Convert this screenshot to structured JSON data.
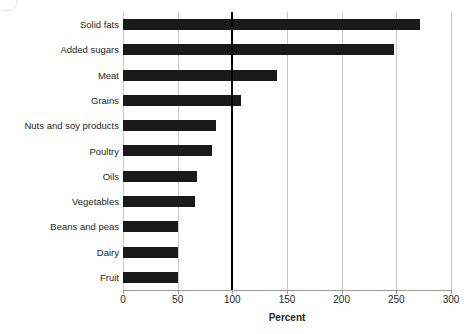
{
  "chart_data": {
    "type": "bar",
    "orientation": "horizontal",
    "title": "",
    "subtitle": "",
    "xlabel": "Percent",
    "ylabel": "",
    "xlim": [
      0,
      300
    ],
    "xticks": [
      0,
      50,
      100,
      150,
      200,
      250,
      300
    ],
    "xtick_labels": [
      "0",
      "50",
      "100",
      "150",
      "200",
      "250",
      "300"
    ],
    "grid": true,
    "grid_axis": "x",
    "legend": false,
    "legend_position": "none",
    "bar_color": "#1a1a1a",
    "reference_line": {
      "value": 100,
      "label": "",
      "color": "#000000",
      "width_px": 2
    },
    "categories": [
      "Solid fats",
      "Added sugars",
      "Meat",
      "Grains",
      "Nuts and soy products",
      "Poultry",
      "Oils",
      "Vegetables",
      "Beans and peas",
      "Dairy",
      "Fruit"
    ],
    "values": [
      272,
      248,
      141,
      108,
      85,
      81,
      68,
      66,
      50,
      50,
      50
    ],
    "points": [
      {
        "category": "Solid fats",
        "value": 272
      },
      {
        "category": "Added sugars",
        "value": 248
      },
      {
        "category": "Meat",
        "value": 141
      },
      {
        "category": "Grains",
        "value": 108
      },
      {
        "category": "Nuts and soy products",
        "value": 85
      },
      {
        "category": "Poultry",
        "value": 81
      },
      {
        "category": "Oils",
        "value": 68
      },
      {
        "category": "Vegetables",
        "value": 66
      },
      {
        "category": "Beans and peas",
        "value": 50
      },
      {
        "category": "Dairy",
        "value": 50
      },
      {
        "category": "Fruit",
        "value": 50
      }
    ]
  }
}
